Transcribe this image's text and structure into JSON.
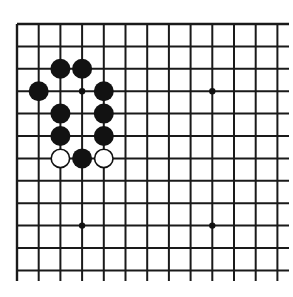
{
  "board": {
    "description": "Go board fragment (upper-left portion), diagram problem",
    "columns": 13,
    "rows": 12,
    "origin_px": [
      17,
      24
    ],
    "col_spacing_px": 21.7,
    "row_spacing_px": 22.4,
    "line_color": "#1a1a1a",
    "background": "#ffffff",
    "right_edge_open": true,
    "bottom_edge_open": true,
    "horizontal_extend_to_px": 289,
    "vertical_extend_to_px": 281,
    "star_points": [
      {
        "col": 3,
        "row": 3
      },
      {
        "col": 9,
        "row": 3
      },
      {
        "col": 3,
        "row": 9
      },
      {
        "col": 9,
        "row": 9
      }
    ],
    "stones": [
      {
        "color": "black",
        "col": 2,
        "row": 2
      },
      {
        "color": "black",
        "col": 3,
        "row": 2
      },
      {
        "color": "black",
        "col": 1,
        "row": 3
      },
      {
        "color": "black",
        "col": 4,
        "row": 3
      },
      {
        "color": "black",
        "col": 2,
        "row": 4
      },
      {
        "color": "black",
        "col": 4,
        "row": 4
      },
      {
        "color": "black",
        "col": 2,
        "row": 5
      },
      {
        "color": "black",
        "col": 4,
        "row": 5
      },
      {
        "color": "white",
        "col": 2,
        "row": 6
      },
      {
        "color": "black",
        "col": 3,
        "row": 6
      },
      {
        "color": "white",
        "col": 4,
        "row": 6
      }
    ],
    "stone_diameter_px": 20,
    "colors": {
      "black_stone": "#121212",
      "white_stone": "#ffffff",
      "white_stone_outline": "#111111"
    }
  }
}
